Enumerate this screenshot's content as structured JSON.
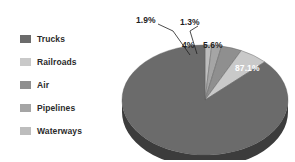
{
  "chart_data": {
    "type": "pie",
    "title": "",
    "subtitle": "",
    "xlabel": "",
    "ylabel": "",
    "legend_position": "left",
    "three_d": true,
    "categories": [
      "Trucks",
      "Railroads",
      "Air",
      "Pipelines",
      "Waterways"
    ],
    "values": [
      87.1,
      5.6,
      4.0,
      1.9,
      1.3
    ],
    "value_labels": [
      "87.1%",
      "5.6%",
      "4%",
      "1.9%",
      "1.3%"
    ],
    "slice_colors": [
      "#6b6b6b",
      "#c9c9c9",
      "#8f8f8f",
      "#a5a5a5",
      "#bdbdbd"
    ],
    "rim_color": "#3c3c3c",
    "label_text_colors": [
      "#ffffff",
      "#1f1f1f",
      "#1f1f1f",
      "#1f1f1f",
      "#1f1f1f"
    ],
    "slices": [
      {
        "name": "Trucks",
        "value": 87.1,
        "label": "87.1%",
        "color": "#6b6b6b",
        "label_inside": true,
        "leader_line": false
      },
      {
        "name": "Railroads",
        "value": 5.6,
        "label": "5.6%",
        "color": "#c9c9c9",
        "label_inside": true,
        "leader_line": false
      },
      {
        "name": "Air",
        "value": 4.0,
        "label": "4%",
        "color": "#8f8f8f",
        "label_inside": true,
        "leader_line": false
      },
      {
        "name": "Pipelines",
        "value": 1.9,
        "label": "1.9%",
        "color": "#a5a5a5",
        "label_inside": false,
        "leader_line": true
      },
      {
        "name": "Waterways",
        "value": 1.3,
        "label": "1.3%",
        "color": "#bdbdbd",
        "label_inside": false,
        "leader_line": true
      }
    ]
  },
  "legend": {
    "items": [
      {
        "label": "Trucks",
        "color": "#6b6b6b"
      },
      {
        "label": "Railroads",
        "color": "#c9c9c9"
      },
      {
        "label": "Air",
        "color": "#8f8f8f"
      },
      {
        "label": "Pipelines",
        "color": "#a5a5a5"
      },
      {
        "label": "Waterways",
        "color": "#bdbdbd"
      }
    ]
  },
  "labels": {
    "trucks_pct": "87.1%",
    "railroads_pct": "5.6%",
    "air_pct": "4%",
    "pipelines_pct": "1.9%",
    "waterways_pct": "1.3%"
  }
}
